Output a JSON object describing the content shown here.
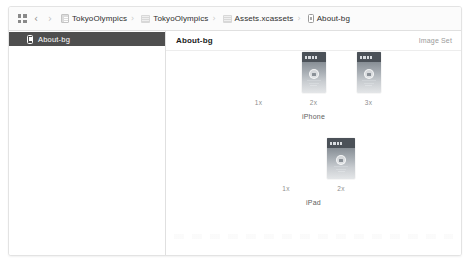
{
  "window": {
    "toolbar": {
      "editor_options_icon": "grid-icon",
      "back_label": "‹",
      "forward_label": "›",
      "breadcrumbs": [
        {
          "icon": "project-document-icon",
          "label": "TokyoOlympics"
        },
        {
          "icon": "folder-icon",
          "label": "TokyoOlympics"
        },
        {
          "icon": "folder-icon",
          "label": "Assets.xcassets"
        },
        {
          "icon": "image-asset-icon",
          "label": "About-bg"
        }
      ],
      "separator": "›"
    },
    "sidebar": {
      "items": [
        {
          "icon": "image-asset-icon",
          "label": "About-bg",
          "selected": true
        }
      ]
    },
    "detail": {
      "title": "About-bg",
      "kind": "Image Set",
      "groups": [
        {
          "name": "iPhone",
          "slots": [
            {
              "scale": "1x",
              "has_image": false
            },
            {
              "scale": "2x",
              "has_image": true
            },
            {
              "scale": "3x",
              "has_image": true
            }
          ]
        },
        {
          "name": "iPad",
          "slots": [
            {
              "scale": "1x",
              "has_image": false
            },
            {
              "scale": "2x",
              "has_image": true
            }
          ]
        }
      ]
    }
  },
  "colors": {
    "selection": "#4f4f4f",
    "toolbar_bg": "#fbfbfb",
    "border": "#e0e0e0",
    "text_primary": "#1c1c1c",
    "text_muted": "#9b9b9b"
  }
}
